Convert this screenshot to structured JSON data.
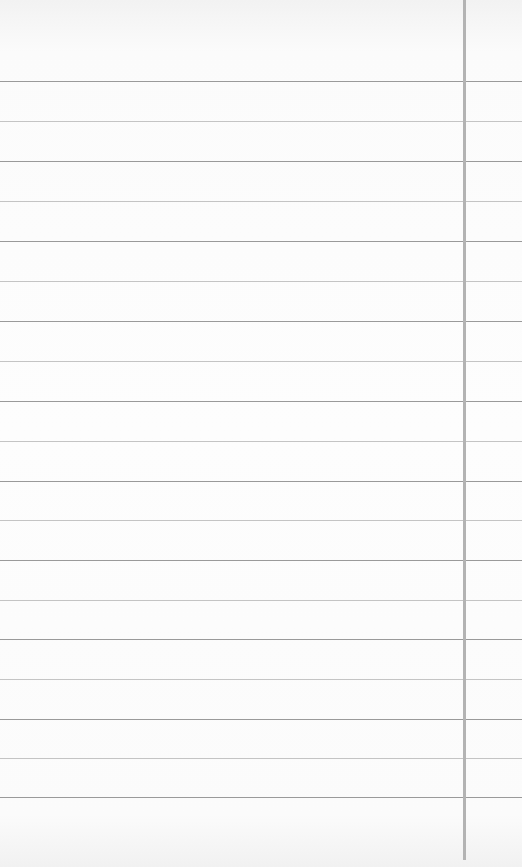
{
  "paper": {
    "type": "lined-paper",
    "background": "#fbfbfb",
    "rule_color_dark": "#9a9a9a",
    "rule_color_light": "#c4c4c4",
    "margin_line_color": "#b3b3b3",
    "margin_line_x": 463,
    "rules_y": [
      81,
      121,
      161,
      201,
      241,
      281,
      321,
      361,
      401,
      441,
      481,
      520,
      560,
      600,
      639,
      679,
      719,
      758,
      797
    ]
  }
}
